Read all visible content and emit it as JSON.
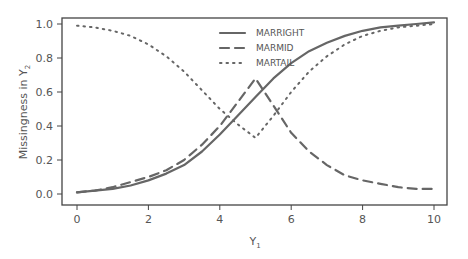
{
  "chart_data": {
    "type": "line",
    "title": "",
    "xlabel": "Y",
    "xlabel_sub": "1",
    "ylabel": "Missingness in Y",
    "ylabel_sub": "2",
    "xlim": [
      -0.7,
      10.6
    ],
    "ylim": [
      -0.06,
      1.04
    ],
    "xticks": [
      0,
      2,
      4,
      6,
      8,
      10
    ],
    "xtick_labels": [
      "0",
      "2",
      "4",
      "6",
      "8",
      "10"
    ],
    "yticks": [
      0.0,
      0.2,
      0.4,
      0.6,
      0.8,
      1.0
    ],
    "ytick_labels": [
      "0.0",
      "0.2",
      "0.4",
      "0.6",
      "0.8",
      "1.0"
    ],
    "grid": false,
    "legend_position": "upper center",
    "x": [
      0,
      0.5,
      1,
      1.5,
      2,
      2.5,
      3,
      3.5,
      4,
      4.5,
      5,
      5.5,
      6,
      6.5,
      7,
      7.5,
      8,
      8.5,
      9,
      9.5,
      10
    ],
    "series": [
      {
        "name": "MARRIGHT",
        "style": "solid",
        "values": [
          0.01,
          0.02,
          0.03,
          0.05,
          0.08,
          0.12,
          0.17,
          0.25,
          0.35,
          0.46,
          0.57,
          0.68,
          0.77,
          0.84,
          0.89,
          0.93,
          0.96,
          0.98,
          0.99,
          1.0,
          1.01
        ]
      },
      {
        "name": "MARMID",
        "style": "dashed",
        "values": [
          0.01,
          0.02,
          0.04,
          0.07,
          0.1,
          0.14,
          0.2,
          0.29,
          0.4,
          0.54,
          0.68,
          0.52,
          0.36,
          0.25,
          0.17,
          0.11,
          0.08,
          0.06,
          0.04,
          0.03,
          0.03
        ]
      },
      {
        "name": "MARTAIL",
        "style": "dotted",
        "values": [
          0.99,
          0.98,
          0.96,
          0.93,
          0.88,
          0.81,
          0.72,
          0.61,
          0.5,
          0.41,
          0.33,
          0.46,
          0.6,
          0.72,
          0.81,
          0.88,
          0.93,
          0.96,
          0.98,
          0.99,
          1.0
        ]
      }
    ]
  },
  "legend": {
    "items": [
      {
        "label": "MARRIGHT"
      },
      {
        "label": "MARMID"
      },
      {
        "label": "MARTAIL"
      }
    ]
  },
  "colors": {
    "line": "#666666",
    "axis": "#444444",
    "text": "#555555"
  }
}
